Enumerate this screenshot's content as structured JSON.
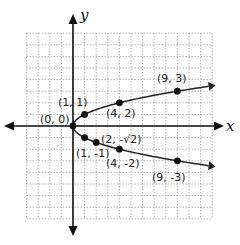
{
  "chart_data": {
    "type": "line",
    "title": "",
    "xlabel": "x",
    "ylabel": "y",
    "xlim": [
      -4,
      12
    ],
    "ylim": [
      -8,
      8
    ],
    "grid": true,
    "relation": "x = y^2",
    "series": [
      {
        "name": "upper branch",
        "x": [
          0,
          1,
          4,
          9
        ],
        "y": [
          0,
          1,
          2,
          3
        ]
      },
      {
        "name": "lower branch",
        "x": [
          0,
          1,
          2,
          4,
          9
        ],
        "y": [
          0,
          -1,
          -1.414,
          -2,
          -3
        ]
      }
    ],
    "annotations": [
      {
        "text": "(0, 0)",
        "x": 0,
        "y": 0
      },
      {
        "text": "(1, 1)",
        "x": 1,
        "y": 1
      },
      {
        "text": "(4, 2)",
        "x": 4,
        "y": 2
      },
      {
        "text": "(9, 3)",
        "x": 9,
        "y": 3
      },
      {
        "text": "(1, -1)",
        "x": 1,
        "y": -1
      },
      {
        "text": "(2, -√2)",
        "x": 2,
        "y": -1.414
      },
      {
        "text": "(4, -2)",
        "x": 4,
        "y": -2
      },
      {
        "text": "(9, -3)",
        "x": 9,
        "y": -3
      }
    ]
  },
  "labels": {
    "x_axis": "x",
    "y_axis": "y",
    "p00": "(0, 0)",
    "p11": "(1, 1)",
    "p42": "(4, 2)",
    "p93": "(9, 3)",
    "p1m1": "(1, -1)",
    "p2mr2": "(2, -√2)",
    "p4m2": "(4, -2)",
    "p9m3": "(9, -3)"
  },
  "colors": {
    "axis": "#111111",
    "grid": "#8a8a8a",
    "curve": "#222222",
    "point": "#111111"
  }
}
